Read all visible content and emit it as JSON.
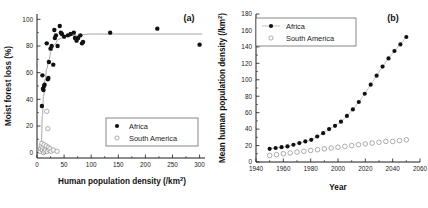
{
  "figure": {
    "panel_a_label": "(a)",
    "panel_b_label": "(b)"
  },
  "legend": {
    "africa": "Africa",
    "south_america": "South America"
  },
  "chart_data": [
    {
      "type": "scatter",
      "panel": "(a)",
      "title": "",
      "xlabel": "Human population density (/km2)",
      "xlabel_base": "Human population density (/km",
      "xlabel_sup": "2",
      "xlabel_tail": ")",
      "ylabel": "Moist forest loss (%)",
      "xlim": [
        0,
        310
      ],
      "ylim": [
        -4,
        104
      ],
      "xticks": [
        0,
        50,
        100,
        150,
        200,
        250,
        300
      ],
      "yticks": [
        0,
        20,
        40,
        60,
        80,
        100
      ],
      "grid": false,
      "legend_position": "lower-right",
      "series": [
        {
          "name": "Africa",
          "marker": "filled-circle",
          "points": [
            [
              9,
              35
            ],
            [
              10,
              58
            ],
            [
              11,
              48
            ],
            [
              12,
              47
            ],
            [
              13,
              50
            ],
            [
              14,
              51
            ],
            [
              18,
              82
            ],
            [
              20,
              55
            ],
            [
              21,
              56
            ],
            [
              22,
              68
            ],
            [
              25,
              78
            ],
            [
              27,
              80
            ],
            [
              30,
              66
            ],
            [
              32,
              92
            ],
            [
              33,
              86
            ],
            [
              35,
              88
            ],
            [
              38,
              80
            ],
            [
              42,
              95
            ],
            [
              44,
              90
            ],
            [
              46,
              89
            ],
            [
              50,
              87
            ],
            [
              57,
              88
            ],
            [
              62,
              89
            ],
            [
              68,
              90
            ],
            [
              70,
              86
            ],
            [
              73,
              84
            ],
            [
              76,
              86
            ],
            [
              80,
              88
            ],
            [
              83,
              82
            ],
            [
              85,
              83
            ],
            [
              135,
              90
            ],
            [
              222,
              93
            ],
            [
              300,
              81
            ]
          ]
        },
        {
          "name": "South America",
          "marker": "open-circle",
          "points": [
            [
              5,
              2
            ],
            [
              6,
              1
            ],
            [
              7,
              3
            ],
            [
              8,
              5
            ],
            [
              9,
              7
            ],
            [
              10,
              2
            ],
            [
              11,
              4
            ],
            [
              12,
              0
            ],
            [
              13,
              6
            ],
            [
              14,
              1
            ],
            [
              15,
              3
            ],
            [
              16,
              2
            ],
            [
              17,
              5
            ],
            [
              18,
              31
            ],
            [
              19,
              1
            ],
            [
              20,
              18
            ],
            [
              21,
              4
            ],
            [
              22,
              2
            ],
            [
              24,
              3
            ],
            [
              26,
              1
            ],
            [
              30,
              2
            ],
            [
              37,
              1
            ]
          ]
        }
      ],
      "fit_curve": {
        "name": "saturating-fit",
        "points": [
          [
            8,
            8
          ],
          [
            10,
            28
          ],
          [
            12,
            42
          ],
          [
            15,
            55
          ],
          [
            18,
            63
          ],
          [
            22,
            70
          ],
          [
            26,
            76
          ],
          [
            32,
            81
          ],
          [
            40,
            85
          ],
          [
            50,
            87
          ],
          [
            70,
            88
          ],
          [
            100,
            89
          ],
          [
            150,
            89
          ],
          [
            220,
            89
          ],
          [
            305,
            89
          ]
        ]
      }
    },
    {
      "type": "line",
      "panel": "(b)",
      "title": "",
      "xlabel": "Year",
      "ylabel": "Mean human population density (/km2)",
      "ylabel_base": "Mean human population density (/km",
      "ylabel_sup": "2",
      "ylabel_tail": ")",
      "xlim": [
        1940,
        2060
      ],
      "ylim": [
        0,
        180
      ],
      "xticks": [
        1940,
        1960,
        1980,
        2000,
        2020,
        2040,
        2060
      ],
      "yticks": [
        0,
        20,
        40,
        60,
        80,
        100,
        120,
        140,
        160,
        180
      ],
      "grid": false,
      "legend_position": "upper-left",
      "x": [
        1950,
        1955,
        1960,
        1965,
        1970,
        1975,
        1980,
        1985,
        1990,
        1995,
        2000,
        2005,
        2010,
        2015,
        2020,
        2025,
        2030,
        2035,
        2040,
        2045,
        2050
      ],
      "series": [
        {
          "name": "Africa",
          "marker": "filled-circle",
          "line": true,
          "values": [
            16,
            17,
            18,
            19,
            21,
            23,
            25,
            27,
            31,
            35,
            40,
            44,
            49,
            56,
            64,
            73,
            83,
            94,
            105,
            116,
            126,
            135,
            143,
            152
          ]
        },
        {
          "name": "South America",
          "marker": "open-circle",
          "line": false,
          "values": [
            8,
            9,
            10,
            11,
            12,
            13,
            14,
            15,
            16,
            17,
            18,
            19,
            20,
            21,
            22,
            23,
            24,
            25,
            25,
            26,
            27
          ]
        }
      ]
    }
  ]
}
